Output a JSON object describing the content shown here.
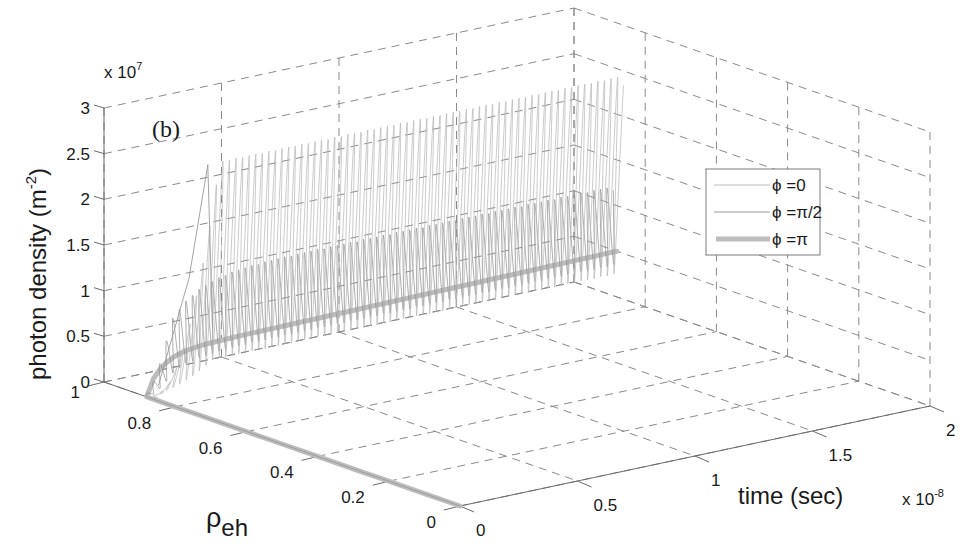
{
  "chart_data": {
    "type": "line3d",
    "panel_label": "(b)",
    "title": "",
    "xlabel": "time (sec)",
    "x_multiplier": "x 10^-8",
    "ylabel": "ρeh",
    "zlabel": "photon density (m^-2)",
    "z_multiplier": "x 10^7",
    "xlim": [
      0,
      2e-08
    ],
    "ylim": [
      0,
      1
    ],
    "zlim": [
      0,
      30000000.0
    ],
    "x_ticks": [
      "0",
      "0.5",
      "1",
      "1.5",
      "2"
    ],
    "y_ticks": [
      "0",
      "0.2",
      "0.4",
      "0.6",
      "0.8",
      "1"
    ],
    "z_ticks": [
      "0",
      "0.5",
      "1",
      "1.5",
      "2",
      "2.5",
      "3"
    ],
    "grid": true,
    "legend_position": "right",
    "legend": [
      {
        "label": "ϕ =0",
        "style": "thin",
        "color": "#b0b0b0"
      },
      {
        "label": "ϕ =π/2",
        "style": "thin",
        "color": "#9a9a9a"
      },
      {
        "label": "ϕ =π",
        "style": "thick",
        "color": "#bdbdbd"
      }
    ],
    "series": [
      {
        "name": "ϕ =0",
        "description": "ρeh drops from 0 to ~0.88 during turn-on, then photon density oscillates strongly between ~0.2e7 and ~2.4e7 over t = 0.2e-8 to 2e-8",
        "points": [
          {
            "t": 0.0,
            "rho": 0.0,
            "S": 0.0
          },
          {
            "t": 0.0,
            "rho": 0.88,
            "S": 0.0
          },
          {
            "t": 1.5e-09,
            "rho": 0.88,
            "S": 3000000.0
          },
          {
            "t": 3e-09,
            "rho": 0.88,
            "S": 25000000.0
          },
          {
            "t": 2e-08,
            "rho": 0.88,
            "S": 24000000.0
          }
        ]
      },
      {
        "name": "ϕ =π/2",
        "description": "oscillating photon density between ~0.3e7 and ~1.2e7",
        "points": [
          {
            "t": 0.0,
            "rho": 0.0,
            "S": 0.0
          },
          {
            "t": 0.0,
            "rho": 0.88,
            "S": 0.0
          },
          {
            "t": 3e-09,
            "rho": 0.88,
            "S": 12000000.0
          },
          {
            "t": 2e-08,
            "rho": 0.88,
            "S": 12000000.0
          }
        ]
      },
      {
        "name": "ϕ =π",
        "description": "steady-state photon density ~0.45e7 with no oscillation",
        "points": [
          {
            "t": 0.0,
            "rho": 0.0,
            "S": 0.0
          },
          {
            "t": 0.0,
            "rho": 0.88,
            "S": 0.0
          },
          {
            "t": 3e-09,
            "rho": 0.88,
            "S": 4500000.0
          },
          {
            "t": 2e-08,
            "rho": 0.88,
            "S": 5000000.0
          }
        ]
      }
    ]
  },
  "labels": {
    "panel": "(b)",
    "z_axis": "photon density (m",
    "z_axis_sup": "-2",
    "z_axis_close": ")",
    "z_mult_base": "x 10",
    "z_mult_exp": "7",
    "x_axis": "time (sec)",
    "x_mult_base": "x 10",
    "x_mult_exp": "-8",
    "y_axis_base": "ρ",
    "y_axis_sub": "eh"
  },
  "ticks": {
    "z": [
      "0",
      "0.5",
      "1",
      "1.5",
      "2",
      "2.5",
      "3"
    ],
    "rho": [
      "1",
      "0.8",
      "0.6",
      "0.4",
      "0.2",
      "0"
    ],
    "t": [
      "0",
      "0.5",
      "1",
      "1.5",
      "2"
    ]
  },
  "legend": {
    "items": [
      "ϕ =0",
      "ϕ =π/2",
      "ϕ =π"
    ]
  }
}
